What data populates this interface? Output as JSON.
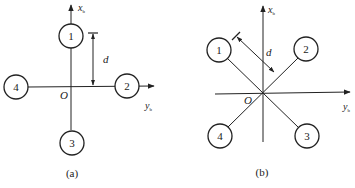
{
  "figure_a": {
    "caption": "(a)",
    "x_axis_label": "x",
    "x_axis_sub": "b",
    "y_axis_label": "y",
    "y_axis_sub": "b",
    "origin_label": "O",
    "dimension_label": "d",
    "rotors": [
      {
        "id": "1",
        "label": "1"
      },
      {
        "id": "2",
        "label": "2"
      },
      {
        "id": "3",
        "label": "3"
      },
      {
        "id": "4",
        "label": "4"
      }
    ]
  },
  "figure_b": {
    "caption": "(b)",
    "x_axis_label": "x",
    "x_axis_sub": "b",
    "y_axis_label": "y",
    "y_axis_sub": "b",
    "origin_label": "O",
    "dimension_label": "d",
    "rotors": [
      {
        "id": "1",
        "label": "1"
      },
      {
        "id": "2",
        "label": "2"
      },
      {
        "id": "3",
        "label": "3"
      },
      {
        "id": "4",
        "label": "4"
      }
    ]
  },
  "colors": {
    "stroke": "#222222",
    "background": "#ffffff"
  }
}
